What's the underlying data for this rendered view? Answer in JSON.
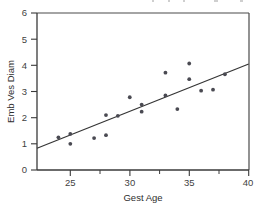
{
  "chart_data": {
    "type": "scatter",
    "title": "",
    "xlabel": "Gest Age",
    "ylabel": "Emb Ves Diam",
    "xlim": [
      22.2,
      40
    ],
    "ylim": [
      0,
      6
    ],
    "x_ticks": [
      25,
      30,
      35,
      40
    ],
    "x_tick_labels": [
      "25",
      "30",
      "35",
      "40"
    ],
    "x_minor_ticks": [
      27.5,
      32.5,
      37.5
    ],
    "y_ticks": [
      0,
      1,
      2,
      3,
      4,
      5,
      6
    ],
    "y_tick_labels": [
      "0",
      "1",
      "2",
      "3",
      "4",
      "5",
      "6"
    ],
    "grid": false,
    "legend": false,
    "marker": "filled-circle",
    "marker_color": "#4a4a52",
    "points": [
      {
        "x": 24.0,
        "y": 1.25
      },
      {
        "x": 25.0,
        "y": 1.38
      },
      {
        "x": 25.0,
        "y": 1.0
      },
      {
        "x": 27.0,
        "y": 1.22
      },
      {
        "x": 28.0,
        "y": 2.1
      },
      {
        "x": 28.0,
        "y": 1.33
      },
      {
        "x": 29.0,
        "y": 2.07
      },
      {
        "x": 30.0,
        "y": 2.78
      },
      {
        "x": 31.0,
        "y": 2.5
      },
      {
        "x": 31.0,
        "y": 2.23
      },
      {
        "x": 33.0,
        "y": 3.72
      },
      {
        "x": 33.0,
        "y": 2.85
      },
      {
        "x": 34.0,
        "y": 2.33
      },
      {
        "x": 35.0,
        "y": 4.07
      },
      {
        "x": 35.0,
        "y": 3.47
      },
      {
        "x": 36.0,
        "y": 3.03
      },
      {
        "x": 37.0,
        "y": 3.07
      },
      {
        "x": 38.0,
        "y": 3.66
      }
    ],
    "fit_line": {
      "label": "",
      "x_start": 22.2,
      "y_start": 0.83,
      "x_end": 40.0,
      "y_end": 4.05,
      "slope": 0.181,
      "intercept": -3.19,
      "color": "#353535"
    }
  }
}
